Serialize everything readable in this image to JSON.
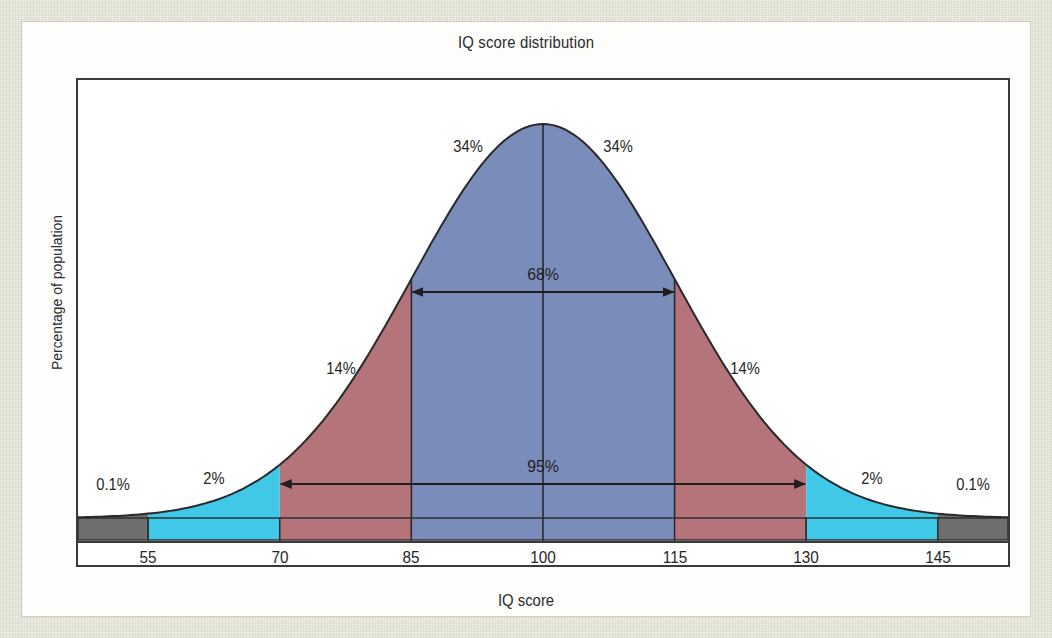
{
  "chart_data": {
    "type": "area",
    "title": "IQ score distribution",
    "xlabel": "IQ score",
    "ylabel": "Percentage of population",
    "distribution": {
      "name": "normal",
      "mean": 100,
      "std_dev": 15
    },
    "xlim": [
      47,
      153
    ],
    "axis_ticks": [
      55,
      70,
      85,
      100,
      115,
      130,
      145
    ],
    "tick_labels": [
      "55",
      "70",
      "85",
      "100",
      "115",
      "130",
      "145"
    ],
    "grid": false,
    "legend": "none",
    "bands": [
      {
        "id": "low-extreme",
        "label": "0.1%",
        "from": 47,
        "to": 55,
        "color": "#6e6e6e",
        "value": 0.1
      },
      {
        "id": "low-2",
        "label": "2%",
        "from": 55,
        "to": 70,
        "color": "#3fc8e8",
        "value": 2
      },
      {
        "id": "low-14",
        "label": "14%",
        "from": 70,
        "to": 85,
        "color": "#b5737a",
        "value": 14
      },
      {
        "id": "mid-34-left",
        "label": "34%",
        "from": 85,
        "to": 100,
        "color": "#7a8cba",
        "value": 34
      },
      {
        "id": "mid-34-right",
        "label": "34%",
        "from": 100,
        "to": 115,
        "color": "#7a8cba",
        "value": 34
      },
      {
        "id": "high-14",
        "label": "14%",
        "from": 115,
        "to": 130,
        "color": "#b5737a",
        "value": 14
      },
      {
        "id": "high-2",
        "label": "2%",
        "from": 130,
        "to": 145,
        "color": "#3fc8e8",
        "value": 2
      },
      {
        "id": "high-extreme",
        "label": "0.1%",
        "from": 145,
        "to": 153,
        "color": "#6e6e6e",
        "value": 0.1
      }
    ],
    "span_annotations": [
      {
        "id": "span-68",
        "label": "68%",
        "from": 85,
        "to": 115,
        "value": 68
      },
      {
        "id": "span-95",
        "label": "95%",
        "from": 70,
        "to": 130,
        "value": 95
      }
    ],
    "percent_labels": [
      {
        "id": "pct-0-1-left",
        "text": "0.1%"
      },
      {
        "id": "pct-2-left",
        "text": "2%"
      },
      {
        "id": "pct-14-left",
        "text": "14%"
      },
      {
        "id": "pct-34-left",
        "text": "34%"
      },
      {
        "id": "pct-34-right",
        "text": "34%"
      },
      {
        "id": "pct-14-right",
        "text": "14%"
      },
      {
        "id": "pct-2-right",
        "text": "2%"
      },
      {
        "id": "pct-0-1-right",
        "text": "0.1%"
      }
    ],
    "colors": {
      "blue": "#7a8cba",
      "red": "#b5737a",
      "cyan": "#3fc8e8",
      "gray": "#6e6e6e",
      "curve_outline": "#2a2a2a",
      "frame": "#3a3a3a",
      "page_background": "#efeee5"
    }
  }
}
